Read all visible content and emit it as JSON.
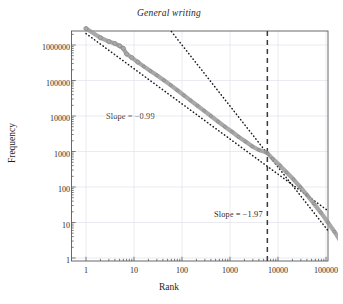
{
  "chart_data": {
    "type": "scatter",
    "title": "General writing",
    "xlabel": "Rank",
    "ylabel": "Frequency",
    "xscale": "log",
    "yscale": "log",
    "xlim": [
      1,
      400000
    ],
    "ylim": [
      1,
      3000000
    ],
    "grid": true,
    "grid_axis": "both",
    "xticks": [
      1,
      10,
      100,
      1000,
      10000,
      100000
    ],
    "xtick_labels": [
      "1",
      "10",
      "100",
      "1000",
      "10000",
      "100000"
    ],
    "yticks": [
      1,
      10,
      100,
      1000,
      10000,
      100000,
      1000000
    ],
    "ytick_labels": [
      "1",
      "10",
      "100",
      "1000",
      "10000",
      "100000",
      "1000000"
    ],
    "legend": null,
    "series": [
      {
        "name": "rank-frequency data",
        "marker": "open-circle",
        "color": "#9a9a9a",
        "x": [
          1,
          2,
          3,
          4,
          5,
          6,
          7,
          9,
          12,
          16,
          22,
          30,
          42,
          58,
          80,
          110,
          150,
          210,
          290,
          400,
          560,
          780,
          1100,
          1500,
          2100,
          2900,
          4000,
          5600,
          6000,
          7800,
          11000,
          15000,
          21000,
          29000,
          40000,
          56000,
          78000,
          110000,
          150000,
          200000,
          260000,
          300000
        ],
        "y": [
          2900000,
          1600000,
          1250000,
          1100000,
          950000,
          800000,
          560000,
          440000,
          330000,
          250000,
          185000,
          140000,
          102000,
          74000,
          53000,
          38000,
          27500,
          19500,
          14000,
          10000,
          7000,
          5000,
          3600,
          2600,
          1900,
          1400,
          1100,
          950,
          900,
          620,
          400,
          260,
          165,
          100,
          60,
          34,
          19,
          10,
          5.5,
          3,
          1.6,
          1
        ]
      }
    ],
    "fit_lines": [
      {
        "name": "low-rank power law fit",
        "slope": -0.99,
        "style": "dotted",
        "color": "#1a1a1a",
        "label": "Slope = −0.99",
        "x_start": 1,
        "x_end": 340000,
        "y_start": 2100000,
        "y_end": 7
      },
      {
        "name": "high-rank power law fit",
        "slope": -1.97,
        "style": "dotted",
        "color": "#1a1a1a",
        "label": "Slope = −1.97",
        "x_start": 60,
        "x_end": 340000,
        "y_start": 2400000,
        "y_end": 0.85
      }
    ],
    "reference_lines": [
      {
        "name": "breakpoint",
        "orientation": "vertical",
        "x": 6000,
        "style": "dashed",
        "color": "#3a3a3a"
      }
    ],
    "annotations": [
      {
        "text": "Slope = −0.99",
        "x": 33,
        "y": 17000
      },
      {
        "text": "Slope = −1.97",
        "x": 3600,
        "y": 18
      }
    ]
  }
}
